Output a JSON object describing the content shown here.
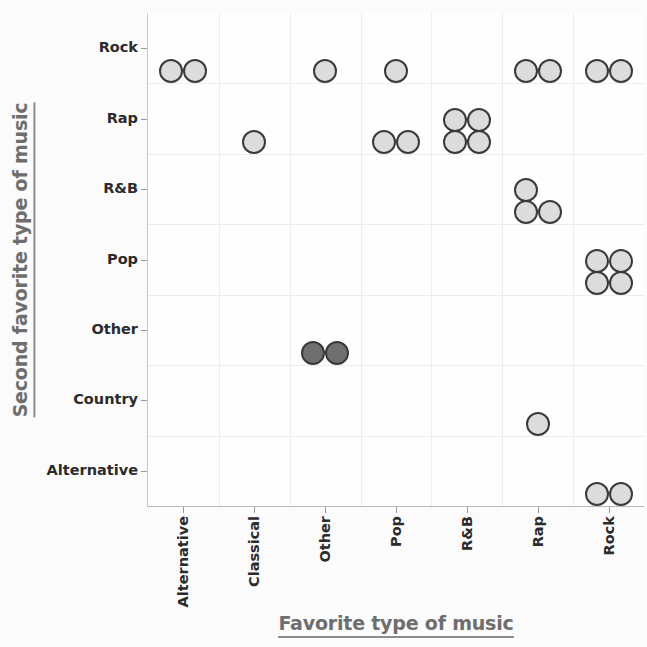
{
  "chart_data": {
    "type": "scatter",
    "plot_style": "dot-plot",
    "title": "",
    "xlabel": "Favorite type of music",
    "ylabel": "Second favorite type of music",
    "grid": true,
    "legend": "none",
    "x_categories": [
      "Alternative",
      "Classical",
      "Other",
      "Pop",
      "R&B",
      "Rap",
      "Rock"
    ],
    "y_categories": [
      "Alternative",
      "Country",
      "Other",
      "Pop",
      "R&B",
      "Rap",
      "Rock"
    ],
    "y_categories_top_to_bottom": [
      "Rock",
      "Rap",
      "R&B",
      "Pop",
      "Other",
      "Country",
      "Alternative"
    ],
    "marker_colors": {
      "default_fill": "#dcdcdc",
      "highlight_fill": "#6f6f6f",
      "edge": "#3a3a3a"
    },
    "cells": [
      {
        "x": "Alternative",
        "y": "Rock",
        "count": 2,
        "highlight": false
      },
      {
        "x": "Classical",
        "y": "Rap",
        "count": 1,
        "highlight": false
      },
      {
        "x": "Other",
        "y": "Rock",
        "count": 1,
        "highlight": false
      },
      {
        "x": "Other",
        "y": "Other",
        "count": 2,
        "highlight": true
      },
      {
        "x": "Pop",
        "y": "Rock",
        "count": 1,
        "highlight": false
      },
      {
        "x": "Pop",
        "y": "Rap",
        "count": 2,
        "highlight": false
      },
      {
        "x": "R&B",
        "y": "Rap",
        "count": 4,
        "highlight": false
      },
      {
        "x": "Rap",
        "y": "Rock",
        "count": 2,
        "highlight": false
      },
      {
        "x": "Rap",
        "y": "R&B",
        "count": 3,
        "highlight": false
      },
      {
        "x": "Rap",
        "y": "Country",
        "count": 1,
        "highlight": false
      },
      {
        "x": "Rock",
        "y": "Rock",
        "count": 2,
        "highlight": false
      },
      {
        "x": "Rock",
        "y": "Pop",
        "count": 4,
        "highlight": false
      },
      {
        "x": "Rock",
        "y": "Alternative",
        "count": 2,
        "highlight": false
      }
    ],
    "total_points": 26
  },
  "axes": {
    "x": {
      "title": "Favorite type of music",
      "ticks": [
        {
          "label": "Alternative"
        },
        {
          "label": "Classical"
        },
        {
          "label": "Other"
        },
        {
          "label": "Pop"
        },
        {
          "label": "R&B"
        },
        {
          "label": "Rap"
        },
        {
          "label": "Rock"
        }
      ]
    },
    "y": {
      "title": "Second favorite type of music",
      "ticks": [
        {
          "label": "Rock"
        },
        {
          "label": "Rap"
        },
        {
          "label": "R&B"
        },
        {
          "label": "Pop"
        },
        {
          "label": "Other"
        },
        {
          "label": "Country"
        },
        {
          "label": "Alternative"
        }
      ]
    }
  }
}
